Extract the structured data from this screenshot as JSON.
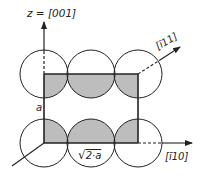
{
  "diagram": {
    "type": "crystal-unit-cell-cross-section",
    "colors": {
      "line": "#222222",
      "fill": "#bdbdbd",
      "background": "#ffffff"
    },
    "axes": {
      "z": {
        "label": "z = [001]",
        "direction": "up"
      },
      "diag": {
        "label": "[ī11]",
        "direction": "up-right",
        "style": "dashed"
      },
      "x": {
        "label": "[ī10]",
        "direction": "right",
        "style": "dashed"
      }
    },
    "dimensions": {
      "height_label": "a",
      "width_label": "√2·a",
      "width_sqrt": "√",
      "width_rest": "2·a"
    },
    "atoms": {
      "rows": 2,
      "cols": 3,
      "description": "Two rows of three touching circles; shaded region is the rectangular cell cross-section intersected with the circles"
    }
  }
}
